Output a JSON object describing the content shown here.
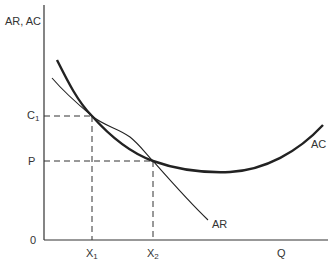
{
  "diagram": {
    "y_axis_label": "AR, AC",
    "x_axis_label": "Q",
    "origin_label": "0",
    "y_ticks": [
      {
        "base": "C",
        "sub": "1"
      },
      {
        "base": "P",
        "sub": ""
      }
    ],
    "x_ticks": [
      {
        "base": "X",
        "sub": "1"
      },
      {
        "base": "X",
        "sub": "2"
      }
    ],
    "curves": [
      {
        "name": "AC",
        "label": "AC",
        "style": "thick"
      },
      {
        "name": "AR",
        "label": "AR",
        "style": "thin"
      }
    ],
    "intersections": [
      {
        "x_label": "X1",
        "y_label": "C1"
      },
      {
        "x_label": "X2",
        "y_label": "P"
      }
    ],
    "colors": {
      "line": "#222222",
      "text": "#333333",
      "background": "#ffffff"
    }
  }
}
